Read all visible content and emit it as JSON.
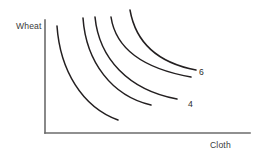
{
  "figure": {
    "type": "indifference-curve-diagram",
    "background_color": "#ffffff",
    "axis_color": "#6b6b6b",
    "curve_color": "#231f20",
    "y_axis_label": "Wheat",
    "x_axis_label": "Cloth"
  },
  "chart_data": {
    "type": "line",
    "title": "",
    "subtitle": "",
    "xlabel": "Cloth",
    "ylabel": "Wheat",
    "grid": false,
    "legend": "none",
    "axis": {
      "origin_px": [
        45,
        133
      ],
      "y_axis_top_px": [
        45,
        20
      ],
      "x_axis_right_px": [
        250,
        133
      ],
      "xlim": [
        0,
        1
      ],
      "ylim": [
        0,
        1
      ],
      "ticks": []
    },
    "annotations": [
      {
        "text": "Wheat",
        "position_px": [
          16,
          26
        ],
        "role": "y-axis-title"
      },
      {
        "text": "Cloth",
        "position_px": [
          210,
          145
        ],
        "role": "x-axis-title"
      },
      {
        "text": "6",
        "position_px": [
          200,
          72
        ],
        "role": "curve-label",
        "curve": "curve-5"
      },
      {
        "text": "4",
        "position_px": [
          189,
          104
        ],
        "role": "curve-label",
        "curve": "curve-3"
      }
    ],
    "series": [
      {
        "name": "curve-1",
        "label": "",
        "path": "M 57,26 C 60,70 82,107 118,120",
        "start_px": [
          57,
          26
        ],
        "end_px": [
          118,
          120
        ]
      },
      {
        "name": "curve-2",
        "label": "",
        "path": "M 83,18 C 86,62 112,96 151,105",
        "start_px": [
          83,
          18
        ],
        "end_px": [
          151,
          105
        ]
      },
      {
        "name": "curve-3",
        "label": "4",
        "path": "M 95,17 C 99,58 128,90 177,99",
        "start_px": [
          95,
          17
        ],
        "end_px": [
          177,
          99
        ]
      },
      {
        "name": "curve-4",
        "label": "",
        "path": "M 111,17 C 116,50 146,69 191,77",
        "start_px": [
          111,
          17
        ],
        "end_px": [
          191,
          77
        ]
      },
      {
        "name": "curve-5",
        "label": "6",
        "path": "M 130,10 C 136,44 159,63 196,70",
        "start_px": [
          130,
          10
        ],
        "end_px": [
          196,
          70
        ]
      }
    ]
  }
}
